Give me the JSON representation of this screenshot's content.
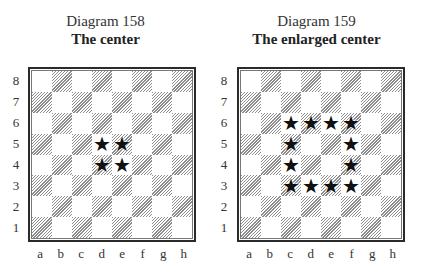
{
  "diagrams": [
    {
      "number_label": "Diagram 158",
      "title": "The center",
      "marked_squares": [
        "d5",
        "e5",
        "d4",
        "e4"
      ]
    },
    {
      "number_label": "Diagram 159",
      "title": "The enlarged center",
      "marked_squares": [
        "c6",
        "d6",
        "e6",
        "f6",
        "c5",
        "f5",
        "c4",
        "f4",
        "c3",
        "d3",
        "e3",
        "f3"
      ]
    }
  ],
  "board": {
    "ranks": [
      "8",
      "7",
      "6",
      "5",
      "4",
      "3",
      "2",
      "1"
    ],
    "files": [
      "a",
      "b",
      "c",
      "d",
      "e",
      "f",
      "g",
      "h"
    ],
    "marker_glyph": "★",
    "marker_icon": "star-icon",
    "light_square_color": "#ffffff",
    "dark_square_style": "diagonal-hatch",
    "dark_hatch_color": "#8c8c8c"
  }
}
